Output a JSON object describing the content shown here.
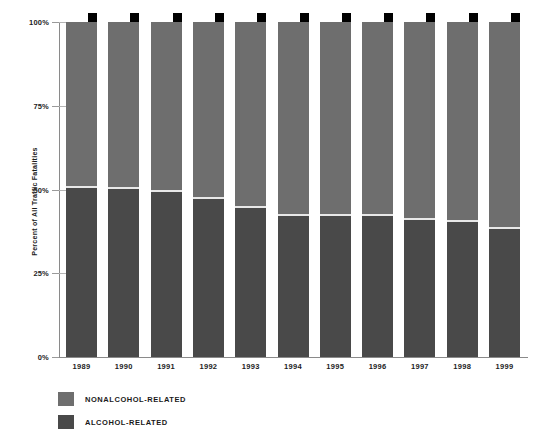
{
  "chart_data": {
    "type": "bar",
    "stacked": true,
    "title": "",
    "xlabel": "",
    "ylabel": "Percent of All Traffic Fatalities",
    "ylim": [
      0,
      100
    ],
    "ytick_labels": [
      "0%",
      "25%",
      "50%",
      "75%",
      "100%"
    ],
    "ytick_values": [
      0,
      25,
      50,
      75,
      100
    ],
    "grid": false,
    "legend_position": "bottom-left",
    "categories": [
      "1989",
      "1990",
      "1991",
      "1992",
      "1993",
      "1994",
      "1995",
      "1996",
      "1997",
      "1998",
      "1999"
    ],
    "series": [
      {
        "name": "NONALCOHOL-RELATED",
        "color": "#6e6e6e",
        "values": [
          49.3,
          49.7,
          50.5,
          52.4,
          55.1,
          57.5,
          57.7,
          57.6,
          58.8,
          59.3,
          61.5
        ]
      },
      {
        "name": "ALCOHOL-RELATED",
        "color": "#494949",
        "values": [
          50.7,
          50.3,
          49.5,
          47.6,
          44.9,
          42.5,
          42.3,
          42.4,
          41.2,
          40.7,
          38.5
        ]
      }
    ]
  },
  "axis": {
    "ylabel_title": "Percent of All Traffic Fatalities"
  },
  "legend": {
    "items": [
      {
        "label": "NONALCOHOL-RELATED",
        "color": "#6e6e6e"
      },
      {
        "label": "ALCOHOL-RELATED",
        "color": "#494949"
      }
    ]
  },
  "colors": {
    "nonalcohol": "#6e6e6e",
    "alcohol": "#494949",
    "shadow": "#000000",
    "axis": "#8a8a8a",
    "divider": "#e8e8e8",
    "background": "#ffffff"
  }
}
